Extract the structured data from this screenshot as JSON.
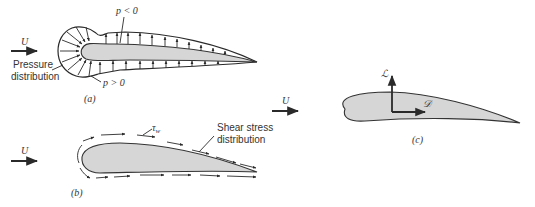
{
  "figure": {
    "panels": [
      {
        "id": "a",
        "caption": "(a)",
        "flow_label": "U",
        "labels": {
          "suction": "p < 0",
          "pressure_positive": "p > 0",
          "pressure_dist_line1": "Pressure",
          "pressure_dist_line2": "distribution"
        }
      },
      {
        "id": "b",
        "caption": "(b)",
        "flow_label": "U",
        "labels": {
          "tau": "τ",
          "tau_sub": "w",
          "shear_line1": "Shear stress",
          "shear_line2": "distribution"
        }
      },
      {
        "id": "c",
        "caption": "(c)",
        "flow_label": "U",
        "labels": {
          "lift": "ℒ",
          "drag": "𝒟"
        }
      }
    ],
    "colors": {
      "airfoil_fill": "#d6d6d6",
      "stroke": "#2a2a2a",
      "text": "#333333"
    }
  }
}
